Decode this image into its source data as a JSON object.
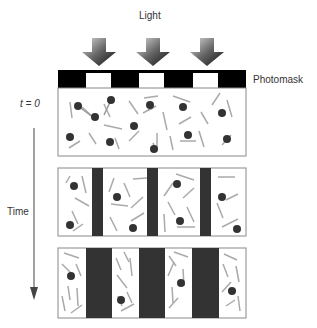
{
  "labels": {
    "light": "Light",
    "photomask": "Photomask",
    "t0": "t = 0",
    "time": "Time"
  },
  "colors": {
    "mask_black": "#000000",
    "dark_band": "#333333",
    "particle": "#333333",
    "rod": "#aaaaaa",
    "frame": "#888888"
  },
  "stages": [
    {
      "name": "initial",
      "description": "uniform mix of particles and rods"
    },
    {
      "name": "intermediate",
      "description": "thin dark bands under masked regions"
    },
    {
      "name": "final",
      "description": "wide dark bands, particles migrate to exposed regions"
    }
  ]
}
